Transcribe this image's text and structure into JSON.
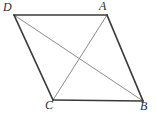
{
  "figure": {
    "kind": "parallelogram-with-diagonals",
    "background_color": "#ffffff",
    "width": 157,
    "height": 114,
    "edge_color": "#3a3a3a",
    "diagonal_color": "#8a8a8a",
    "edge_width": 1.6,
    "diagonal_width": 1.0,
    "label_color": "#2b2b2b",
    "vertices": [
      {
        "name": "D",
        "label": "D",
        "x": 14,
        "y": 15
      },
      {
        "name": "A",
        "label": "A",
        "x": 107,
        "y": 15
      },
      {
        "name": "C",
        "label": "C",
        "x": 53,
        "y": 100
      },
      {
        "name": "B",
        "label": "B",
        "x": 143,
        "y": 101
      }
    ],
    "edges": [
      {
        "name": "edge-DA",
        "from": "D",
        "to": "A"
      },
      {
        "name": "edge-AB",
        "from": "A",
        "to": "B"
      },
      {
        "name": "edge-BC",
        "from": "B",
        "to": "C"
      },
      {
        "name": "edge-CD",
        "from": "C",
        "to": "D"
      }
    ],
    "diagonals": [
      {
        "name": "diagonal-DB",
        "from": "D",
        "to": "B"
      },
      {
        "name": "diagonal-AC",
        "from": "A",
        "to": "C"
      }
    ],
    "intersection": {
      "name": "diagonal-intersection",
      "x": 78,
      "y": 57
    }
  }
}
